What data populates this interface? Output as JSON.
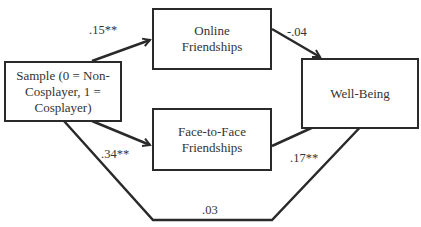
{
  "nodes": {
    "sample": {
      "lines": [
        "Sample (0 = Non-",
        "Cosplayer, 1 =",
        "Cosplayer)"
      ]
    },
    "online": {
      "lines": [
        "Online",
        "Friendships"
      ]
    },
    "face": {
      "lines": [
        "Face-to-Face",
        "Friendships"
      ]
    },
    "wellbeing": {
      "lines": [
        "Well-Being"
      ]
    }
  },
  "paths": {
    "sample_online": ".15**",
    "online_wellbeing": "-.04",
    "sample_face": ".34**",
    "face_wellbeing": ".17**",
    "sample_wellbeing": ".03"
  },
  "colors": {
    "line": "#2a2a2a",
    "text": "#333333"
  }
}
